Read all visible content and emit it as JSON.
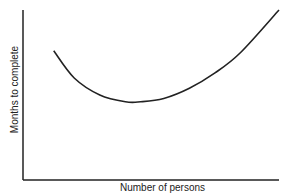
{
  "chart_data": {
    "type": "line",
    "title": "",
    "xlabel": "Number of persons",
    "ylabel": "Months to complete",
    "grid": false,
    "legend": null,
    "ticks": {
      "x": [],
      "y": []
    },
    "series": [
      {
        "name": "Months to complete vs number of persons",
        "description": "U-shaped curve: decreases from start to a minimum near the middle, then rises steeply",
        "x": [
          0.12,
          0.2,
          0.3,
          0.4,
          0.46,
          0.55,
          0.65,
          0.75,
          0.85,
          1.0
        ],
        "y": [
          0.76,
          0.6,
          0.5,
          0.46,
          0.46,
          0.48,
          0.54,
          0.63,
          0.75,
          1.0
        ]
      }
    ],
    "xlim": [
      0,
      1
    ],
    "ylim": [
      0,
      1
    ]
  }
}
